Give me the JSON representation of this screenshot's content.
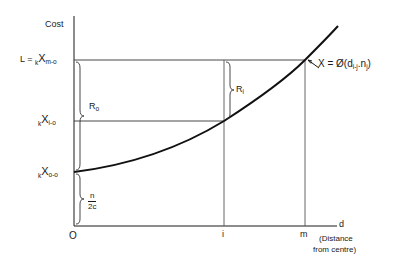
{
  "diagram": {
    "y_axis_label": "Cost",
    "x_axis_label": "d",
    "x_axis_note_line1": "(Distance",
    "x_axis_note_line2": "from centre)",
    "origin_label": "O",
    "x_ticks": [
      {
        "label": "i"
      },
      {
        "label": "m"
      }
    ],
    "y_levels": {
      "top": {
        "prefix": "L = ",
        "k": "k",
        "x": "X",
        "sub": "m-o"
      },
      "mid": {
        "k": "k",
        "x": "X",
        "sub": "i-o"
      },
      "base": {
        "k": "k",
        "x": "X",
        "sub": "o-o"
      }
    },
    "braces": {
      "r0": "R",
      "r0_sub": "o",
      "ri": "R",
      "ri_sub": "i",
      "fraction_num": "n",
      "fraction_den": "2c"
    },
    "curve_annotation": {
      "text": "X = Ø(d",
      "sub1": "i-j",
      "mid": ".n",
      "sub2": "j",
      "close": ")"
    },
    "colors": {
      "line": "#1a1a1a",
      "thin_line": "#333333",
      "background": "#ffffff"
    }
  }
}
